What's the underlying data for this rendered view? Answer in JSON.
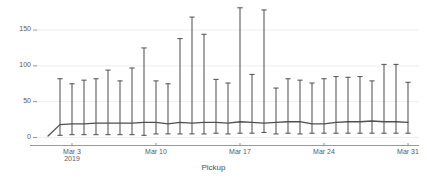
{
  "chart_data": {
    "type": "line",
    "title": "",
    "subtitle": "",
    "xlabel": "Pickup",
    "ylabel": "",
    "grid": true,
    "legend": false,
    "ylim": [
      0,
      185
    ],
    "yticks": [
      0,
      50,
      100,
      150
    ],
    "ytick_labels": [
      "0",
      "50",
      "100",
      "150"
    ],
    "xtick_labels": [
      "Mar 3",
      "Mar 10",
      "Mar 17",
      "Mar 24",
      "Mar 31"
    ],
    "xtick_sublabels": [
      "2019",
      "",
      "",
      "",
      ""
    ],
    "xtick_indices": [
      2,
      9,
      16,
      23,
      30
    ],
    "x": [
      "Mar 1",
      "Mar 2",
      "Mar 3",
      "Mar 4",
      "Mar 5",
      "Mar 6",
      "Mar 7",
      "Mar 8",
      "Mar 9",
      "Mar 10",
      "Mar 11",
      "Mar 12",
      "Mar 13",
      "Mar 14",
      "Mar 15",
      "Mar 16",
      "Mar 17",
      "Mar 18",
      "Mar 19",
      "Mar 20",
      "Mar 21",
      "Mar 22",
      "Mar 23",
      "Mar 24",
      "Mar 25",
      "Mar 26",
      "Mar 27",
      "Mar 28",
      "Mar 29",
      "Mar 30",
      "Mar 31"
    ],
    "series": [
      {
        "name": "mean",
        "values": [
          2,
          18,
          19,
          19,
          20,
          20,
          20,
          20,
          21,
          21,
          19,
          21,
          20,
          21,
          21,
          20,
          22,
          21,
          20,
          21,
          22,
          22,
          19,
          19,
          21,
          22,
          22,
          23,
          22,
          22,
          21
        ]
      },
      {
        "name": "upper",
        "values": [
          2,
          82,
          75,
          80,
          82,
          94,
          79,
          97,
          125,
          79,
          75,
          138,
          168,
          144,
          81,
          76,
          181,
          88,
          178,
          69,
          82,
          80,
          76,
          82,
          85,
          84,
          85,
          79,
          102,
          102,
          77
        ]
      },
      {
        "name": "lower",
        "values": [
          2,
          3,
          4,
          4,
          4,
          4,
          4,
          4,
          3,
          5,
          5,
          5,
          5,
          5,
          6,
          5,
          6,
          6,
          7,
          5,
          6,
          5,
          6,
          6,
          6,
          6,
          6,
          6,
          6,
          6,
          6
        ]
      }
    ],
    "colors": {
      "line": "#4f4f4f",
      "errorbar": "#5a5a5a",
      "grid": "#e8e8e8",
      "axis": "#9a9a9a",
      "text": "#4a4a4a"
    }
  }
}
